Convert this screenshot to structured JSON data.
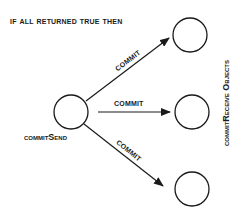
{
  "title": "if all returned true then",
  "sender": {
    "label": "commitSend",
    "center": [
      71,
      112
    ],
    "radius": 17
  },
  "receivers": {
    "group_label": "commitReceive Objects",
    "nodes": [
      {
        "id": "receiver-top",
        "center": [
          190,
          35
        ],
        "radius": 17
      },
      {
        "id": "receiver-middle",
        "center": [
          192,
          112
        ],
        "radius": 17
      },
      {
        "id": "receiver-bottom",
        "center": [
          192,
          189
        ],
        "radius": 17
      }
    ]
  },
  "edges": [
    {
      "label": "COMMIT",
      "from": "sender",
      "to": "receiver-top"
    },
    {
      "label": "COMMIT",
      "from": "sender",
      "to": "receiver-middle"
    },
    {
      "label": "COMMIT",
      "from": "sender",
      "to": "receiver-bottom"
    }
  ],
  "colors": {
    "stroke": "#1a1a1a",
    "background": "#ffffff"
  }
}
